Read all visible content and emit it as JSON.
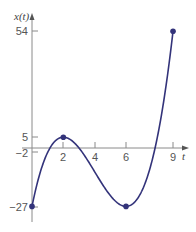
{
  "chart_data": {
    "type": "line",
    "title": "",
    "xlabel": "t",
    "ylabel": "x(t)",
    "function": "x(t) = t^3 - 12t^2 + 36t - 27",
    "x_ticks": [
      2,
      4,
      6,
      9
    ],
    "y_ticks": [
      54,
      5,
      -2,
      -27
    ],
    "xlim": [
      0,
      9
    ],
    "ylim": [
      -27,
      54
    ],
    "grid": false,
    "legend": null,
    "series": [
      {
        "name": "x(t)",
        "color": "#33337a",
        "x": [
          0,
          1,
          2,
          3,
          4,
          5,
          6,
          7,
          8,
          9
        ],
        "values": [
          -27,
          -2,
          5,
          0,
          -11,
          -22,
          -27,
          -20,
          5,
          54
        ]
      }
    ],
    "marked_points": [
      {
        "t": 0,
        "x": -27
      },
      {
        "t": 2,
        "x": 5
      },
      {
        "t": 6,
        "x": -27
      },
      {
        "t": 9,
        "x": 54
      }
    ]
  },
  "labels": {
    "y_axis": "x(t)",
    "x_axis": "t",
    "ytick_54": "54",
    "ytick_5": "5",
    "ytick_m2": "−2",
    "ytick_m27": "−27",
    "xtick_2": "2",
    "xtick_4": "4",
    "xtick_6": "6",
    "xtick_9": "9"
  },
  "colors": {
    "curve": "#33337a",
    "axis": "#8a8a8a"
  }
}
